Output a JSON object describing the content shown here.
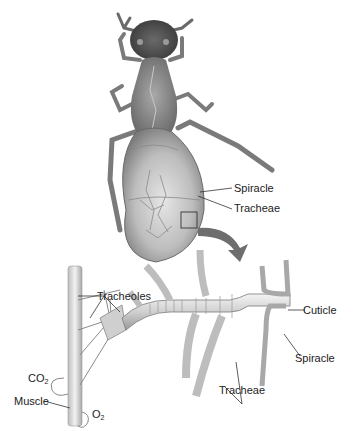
{
  "diagram": {
    "top_panel": {
      "subject": "insect body (dorsal view)",
      "labels": {
        "spiracle": "Spiracle",
        "tracheae": "Tracheae"
      },
      "callout": "magnified-region box with arrow pointing to detail below"
    },
    "bottom_panel": {
      "subject": "magnified tracheal branching to muscle",
      "labels": {
        "tracheoles": "Tracheoles",
        "cuticle": "Cuticle",
        "spiracle": "Spiracle",
        "tracheae": "Tracheae",
        "co2_main": "CO",
        "co2_sub": "2",
        "muscle": "Muscle",
        "o2_main": "O",
        "o2_sub": "2"
      }
    },
    "colors": {
      "body_dark": "#4a4a4a",
      "body_mid": "#8c8c8c",
      "body_light": "#d4d4d4",
      "arrow": "#6e6e6e",
      "line": "#333333",
      "background": "#ffffff"
    }
  }
}
